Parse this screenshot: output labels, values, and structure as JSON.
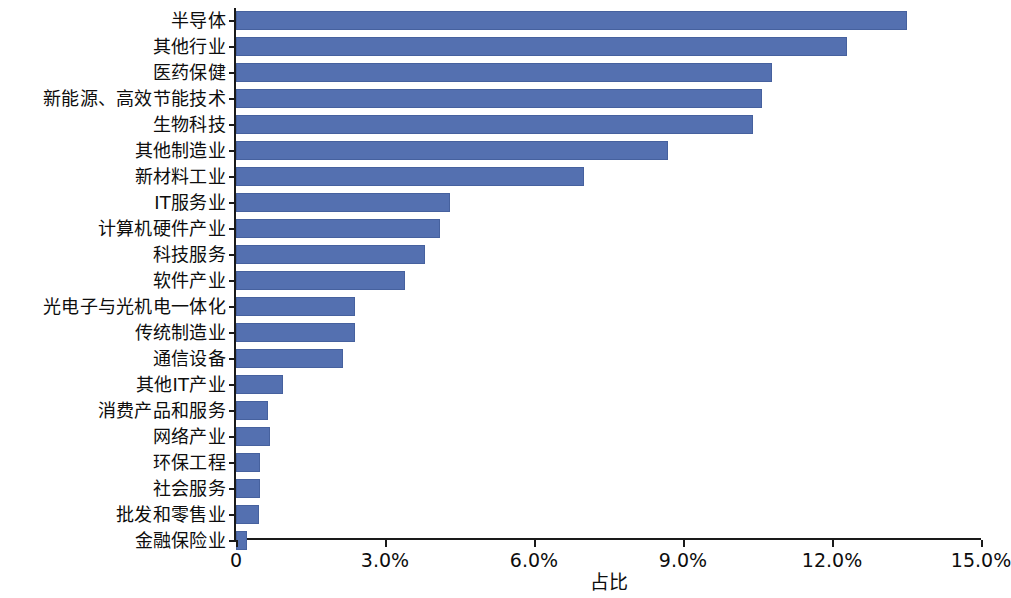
{
  "chart_data": {
    "type": "bar",
    "orientation": "horizontal",
    "title": "",
    "xlabel": "占比",
    "ylabel": "",
    "xlim": [
      0,
      15
    ],
    "xtick_labels": [
      "0",
      "3.0%",
      "6.0%",
      "9.0%",
      "12.0%",
      "15.0%"
    ],
    "xtick_values": [
      0,
      3,
      6,
      9,
      12,
      15
    ],
    "grid": false,
    "legend": null,
    "bar_color": "#5470b0",
    "bar_edge_color": "#46619e",
    "axis_color": "#1a1a1a",
    "unit": "%",
    "categories": [
      "半导体",
      "其他行业",
      "医药保健",
      "新能源、高效节能技术",
      "生物科技",
      "其他制造业",
      "新材料工业",
      "IT服务业",
      "计算机硬件产业",
      "科技服务",
      "软件产业",
      "光电子与光机电一体化",
      "传统制造业",
      "通信设备",
      "其他IT产业",
      "消费产品和服务",
      "网络产业",
      "环保工程",
      "社会服务",
      "批发和零售业",
      "金融保险业"
    ],
    "values": [
      13.5,
      12.3,
      10.8,
      10.6,
      10.4,
      8.7,
      7.0,
      4.3,
      4.1,
      3.8,
      3.4,
      2.4,
      2.4,
      2.15,
      0.95,
      0.65,
      0.68,
      0.48,
      0.48,
      0.46,
      0.22
    ]
  }
}
